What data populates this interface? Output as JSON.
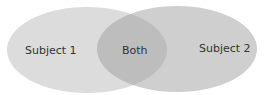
{
  "diagram": {
    "type": "venn",
    "sets": [
      {
        "label": "Subject 1",
        "color": "#dcdcdc"
      },
      {
        "label": "Subject 2",
        "color": "#cfcfcf"
      }
    ],
    "intersection": {
      "label": "Both",
      "color": "#bdbdbd"
    }
  }
}
